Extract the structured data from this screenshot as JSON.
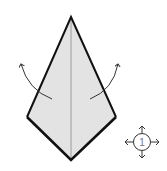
{
  "diagram": {
    "type": "origami-step",
    "colors": {
      "paper_fill": "#e3e3e3",
      "outline": "#111111",
      "crease": "#8a8a8a",
      "arrow": "#333333",
      "symbol": "#555555"
    },
    "kite": {
      "apex": [
        71,
        17
      ],
      "left": [
        27,
        117
      ],
      "bottom": [
        71,
        160
      ],
      "right": [
        116,
        117
      ]
    },
    "arrows": [
      {
        "name": "unfold-left-arrow",
        "from": [
          52,
          99
        ],
        "to": [
          20,
          63
        ]
      },
      {
        "name": "unfold-right-arrow",
        "from": [
          90,
          99
        ],
        "to": [
          119,
          63
        ]
      }
    ],
    "rotation_symbol": {
      "label": "1",
      "center": [
        142,
        142
      ]
    }
  }
}
